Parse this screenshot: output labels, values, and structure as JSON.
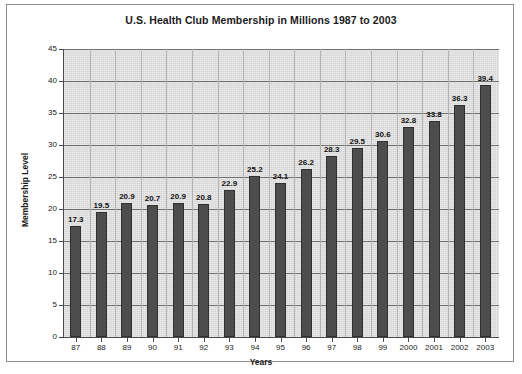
{
  "chart_data": {
    "type": "bar",
    "title": "U.S. Health Club Membership in Millions 1987 to 2003",
    "xlabel": "Years",
    "ylabel": "Membership Level",
    "ylim": [
      0,
      45
    ],
    "ytick_step": 5,
    "yticks": [
      "0",
      "5",
      "10",
      "15",
      "20",
      "25",
      "30",
      "35",
      "40",
      "45"
    ],
    "grid": true,
    "legend": "none",
    "bar_color": "#4d4d4d",
    "plot_background": "#d6d6d6",
    "gridline_color": "#6f6f6f",
    "categories": [
      "87",
      "88",
      "89",
      "90",
      "91",
      "92",
      "93",
      "94",
      "95",
      "96",
      "97",
      "98",
      "99",
      "2000",
      "2001",
      "2002",
      "2003"
    ],
    "values": [
      17.3,
      19.5,
      20.9,
      20.7,
      20.9,
      20.8,
      22.9,
      25.2,
      24.1,
      26.2,
      28.3,
      29.5,
      30.6,
      32.8,
      33.8,
      36.3,
      39.4
    ],
    "value_labels": [
      "17.3",
      "19.5",
      "20.9",
      "20.7",
      "20.9",
      "20.8",
      "22.9",
      "25.2",
      "24.1",
      "26.2",
      "28.3",
      "29.5",
      "30.6",
      "32.8",
      "33.8",
      "36.3",
      "39.4"
    ]
  }
}
